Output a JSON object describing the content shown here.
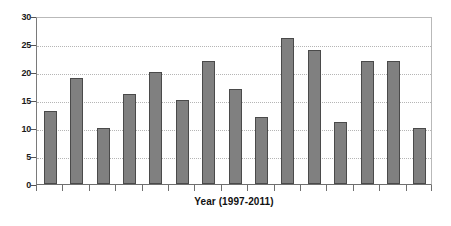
{
  "chart_data": {
    "type": "bar",
    "title": "",
    "subtitle": "",
    "xlabel": "Year (1997-2011)",
    "ylabel": "",
    "categories": [
      "1997",
      "1998",
      "1999",
      "2000",
      "2001",
      "2002",
      "2003",
      "2004",
      "2005",
      "2006",
      "2007",
      "2008",
      "2009",
      "2010",
      "2011"
    ],
    "values": [
      13,
      19,
      10,
      16,
      20,
      15,
      22,
      17,
      12,
      26,
      24,
      11,
      22,
      22,
      10
    ],
    "ylim": [
      0,
      30
    ],
    "yticks": [
      0,
      5,
      10,
      15,
      20,
      25,
      30
    ],
    "ytick_labels": [
      "0",
      "5",
      "10",
      "15",
      "20",
      "25",
      "30"
    ],
    "xtick_labels": [],
    "grid": true,
    "grid_axis": "y",
    "grid_style": "dotted",
    "legend": false,
    "legend_position": "none",
    "series": [
      {
        "name": "",
        "values": [
          13,
          19,
          10,
          16,
          20,
          15,
          22,
          17,
          12,
          26,
          24,
          11,
          22,
          22,
          10
        ]
      }
    ],
    "colors": {
      "bar_fill": "#808080",
      "bar_border": "#4a4a4a",
      "gridline": "#b5b5b5",
      "axis": "#6f6f6f",
      "text": "#111111",
      "background": "#ffffff"
    }
  }
}
